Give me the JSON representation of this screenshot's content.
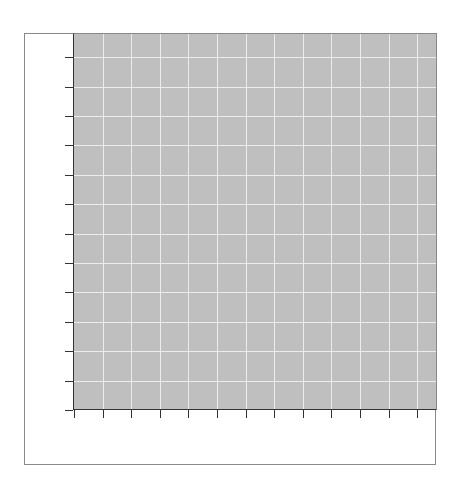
{
  "chart_data": {
    "type": "line",
    "title": "",
    "xlabel": "",
    "ylabel": "",
    "series": [],
    "x_ticks": [
      "",
      "",
      "",
      "",
      "",
      "",
      "",
      "",
      "",
      "",
      "",
      "",
      ""
    ],
    "y_ticks": [
      "",
      "",
      "",
      "",
      "",
      "",
      "",
      "",
      "",
      "",
      "",
      "",
      ""
    ],
    "grid": true,
    "legend": null,
    "colors": {
      "plot_background": "#bfbfbf",
      "grid": "#ececec",
      "axis": "#333333",
      "frame": "#8a8a8a"
    }
  }
}
